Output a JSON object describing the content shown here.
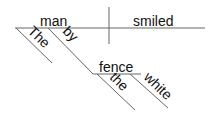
{
  "diagram": {
    "type": "sentence-diagram",
    "subject": "man",
    "predicate": "smiled",
    "modifiers": {
      "subject_article": "The",
      "preposition": "by",
      "object_of_preposition": "fence",
      "object_article": "the",
      "object_adjective": "white"
    },
    "colors": {
      "line": "#666666",
      "text": "#111111"
    }
  }
}
